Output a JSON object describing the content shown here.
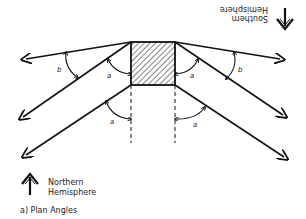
{
  "diagram": {
    "caption": "a) Plan Angles",
    "north_label_line1": "Northern",
    "north_label_line2": "Hemisphere",
    "south_label_line1": "Southern",
    "south_label_line2": "Hemisphere",
    "angle_labels": {
      "left_upper_a": "a",
      "left_lower_a": "a",
      "right_upper_a": "a",
      "right_lower_a": "a",
      "left_b": "b",
      "right_b": "b"
    },
    "north_arrow_icon": "arrow-up-icon",
    "south_arrow_icon": "arrow-down-icon",
    "colors": {
      "ink": "#111111",
      "background": "#ffffff"
    }
  }
}
